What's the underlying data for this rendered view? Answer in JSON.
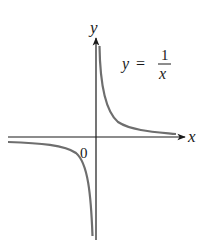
{
  "diagram": {
    "axes": {
      "x_label": "x",
      "y_label": "y",
      "origin_label": "0"
    },
    "equation": {
      "lhs": "y",
      "equals": "=",
      "numerator": "1",
      "denominator": "x"
    },
    "colors": {
      "axis": "#1a1a1a",
      "curve": "#6e6e6e",
      "text": "#1a1a1a"
    }
  }
}
